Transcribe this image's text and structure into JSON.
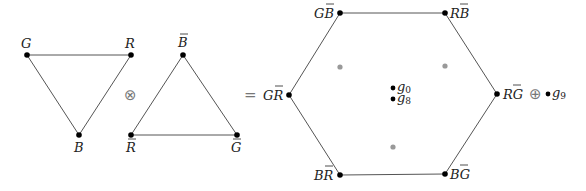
{
  "diagram": {
    "triplet": {
      "vertices": [
        {
          "label": "G",
          "bar": false,
          "x": 27,
          "y": 55
        },
        {
          "label": "R",
          "bar": false,
          "x": 131,
          "y": 55
        },
        {
          "label": "B",
          "bar": false,
          "x": 79,
          "y": 135
        }
      ]
    },
    "tensor_operator": "⊗",
    "antitriplet": {
      "vertices": [
        {
          "label": "B",
          "bar": true,
          "x": 183,
          "y": 55
        },
        {
          "label": "R",
          "bar": true,
          "x": 131,
          "y": 135
        },
        {
          "label": "G",
          "bar": true,
          "x": 237,
          "y": 135
        }
      ]
    },
    "equals_operator": "=",
    "octet_hexagon": {
      "vertices": [
        {
          "label": "GB̄",
          "main": "G",
          "bar": "B",
          "x": 340,
          "y": 13
        },
        {
          "label": "RB̄",
          "main": "R",
          "bar": "B",
          "x": 445,
          "y": 13
        },
        {
          "label": "RḠ",
          "main": "R",
          "bar": "G",
          "x": 497,
          "y": 94
        },
        {
          "label": "BḠ",
          "main": "B",
          "bar": "G",
          "x": 445,
          "y": 174
        },
        {
          "label": "BR̄",
          "main": "B",
          "bar": "R",
          "x": 340,
          "y": 175
        },
        {
          "label": "GR̄",
          "main": "G",
          "bar": "R",
          "x": 289,
          "y": 95
        }
      ],
      "inner_gray_points": [
        {
          "x": 340,
          "y": 67
        },
        {
          "x": 445,
          "y": 66
        },
        {
          "x": 393,
          "y": 147
        }
      ],
      "center_points": [
        {
          "label": "g",
          "sub": "0",
          "x": 393,
          "y": 88
        },
        {
          "label": "g",
          "sub": "8",
          "x": 393,
          "y": 99
        }
      ]
    },
    "direct_sum_operator": "⊕",
    "singlet": {
      "label": "g",
      "sub": "9",
      "x": 548,
      "y": 94
    },
    "colors": {
      "edge": "#555555",
      "vertex": "#000000",
      "gray_point": "#999999",
      "operator": "#777777"
    }
  }
}
